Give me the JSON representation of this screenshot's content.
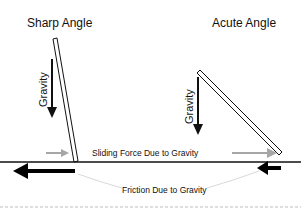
{
  "diagram": {
    "left_panel": {
      "title": "Sharp Angle",
      "gravity_label": "Gravity"
    },
    "right_panel": {
      "title": "Acute Angle",
      "gravity_label": "Gravity"
    },
    "sliding_force_label": "Sliding Force Due to Gravity",
    "friction_label": "Friction Due to Gravity",
    "colors": {
      "board": "#111111",
      "gravity_arrow": "#111111",
      "sliding_arrow": "#a6a6a6",
      "friction_arrow": "#000000",
      "friction_connector": "#d9d9d9",
      "ground": "#111111",
      "dashed_line": "#bdbdbd"
    }
  }
}
